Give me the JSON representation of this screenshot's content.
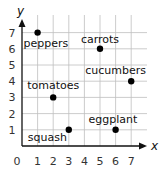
{
  "chart_data": {
    "type": "scatter",
    "title": "",
    "xlabel": "x",
    "ylabel": "y",
    "xlim": [
      0,
      7
    ],
    "ylim": [
      0,
      7
    ],
    "grid": true,
    "legend": null,
    "x_ticks": [
      "0",
      "1",
      "2",
      "3",
      "4",
      "5",
      "6",
      "7"
    ],
    "y_ticks": [
      "1",
      "2",
      "3",
      "4",
      "5",
      "6",
      "7"
    ],
    "points": [
      {
        "label": "peppers",
        "x": 1,
        "y": 7
      },
      {
        "label": "carrots",
        "x": 5,
        "y": 6
      },
      {
        "label": "cucumbers",
        "x": 7,
        "y": 4
      },
      {
        "label": "tomatoes",
        "x": 2,
        "y": 3
      },
      {
        "label": "squash",
        "x": 3,
        "y": 1
      },
      {
        "label": "eggplant",
        "x": 6,
        "y": 1
      }
    ]
  },
  "colors": {
    "grid": "#bfbfbf",
    "axis": "#111111",
    "point": "#000000",
    "text": "#111111"
  }
}
